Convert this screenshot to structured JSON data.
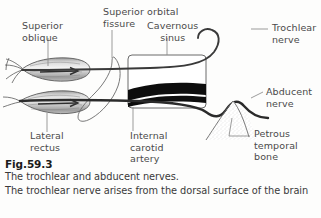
{
  "figure": {
    "number": "Fig.59.3",
    "caption_lines": [
      "The trochlear and abducent nerves.",
      "The trochlear nerve arises from the dorsal surface of the brain"
    ]
  },
  "labels": {
    "superior_oblique": "Superior\noblique",
    "superior_orbital_fissure": "Superior orbital\nfissure",
    "cavernous_sinus": "Cavernous\nsinus",
    "trochlear_nerve": "Trochlear\nnerve",
    "abducent_nerve": "Abducent\nnerve",
    "lateral_rectus": "Lateral\nrectus",
    "internal_carotid_artery": "Internal\ncarotid\nartery",
    "petrous_temporal_bone": "Petrous\ntemporal\nbone"
  },
  "structures": [
    {
      "name": "superior-oblique-muscle",
      "kind": "muscle"
    },
    {
      "name": "lateral-rectus-muscle",
      "kind": "muscle"
    },
    {
      "name": "superior-orbital-fissure-loop",
      "kind": "outline"
    },
    {
      "name": "cavernous-sinus-box",
      "kind": "outline"
    },
    {
      "name": "internal-carotid-artery-band",
      "kind": "filled"
    },
    {
      "name": "trochlear-nerve-path",
      "kind": "nerve"
    },
    {
      "name": "abducent-nerve-path",
      "kind": "nerve"
    },
    {
      "name": "petrous-temporal-bone-shape",
      "kind": "stippled"
    }
  ],
  "colors": {
    "ink": "#3a3a3a",
    "nerve": "#2b2b2b",
    "artery": "#0d0d0d",
    "leader": "#7d7d7d",
    "muscle_light": "#e6e6e6",
    "muscle_dark": "#8c8c8c",
    "background": "#fdfdfc"
  }
}
